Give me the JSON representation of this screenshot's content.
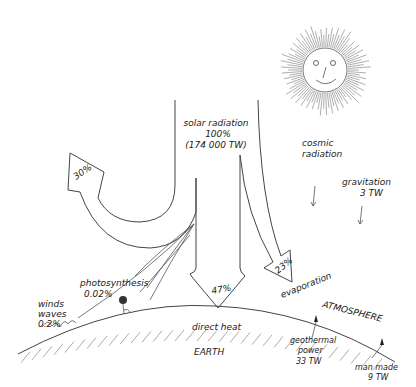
{
  "diagram": {
    "solar": {
      "label": "solar radiation",
      "percent": "100%",
      "power": "(174 000 TW)"
    },
    "reflected": {
      "percent": "30%"
    },
    "direct_heat": {
      "percent": "47%",
      "label": "direct heat"
    },
    "evaporation": {
      "percent": "23%",
      "label": "evaporation"
    },
    "photosynthesis": {
      "label": "photosynthesis",
      "percent": "0.02%"
    },
    "winds_waves": {
      "line1": "winds",
      "line2": "waves",
      "percent": "0.2%"
    },
    "cosmic": {
      "line1": "cosmic",
      "line2": "radiation"
    },
    "gravitation": {
      "label": "gravitation",
      "power": "3 TW"
    },
    "atmosphere": {
      "label": "ATMOSPHERE"
    },
    "earth": {
      "label": "EARTH"
    },
    "geothermal": {
      "line1": "geothermal",
      "line2": "power",
      "power": "33 TW"
    },
    "man_made": {
      "label": "man made",
      "power": "9 TW"
    },
    "sun": {
      "icon": "smiling-sun-icon"
    }
  }
}
